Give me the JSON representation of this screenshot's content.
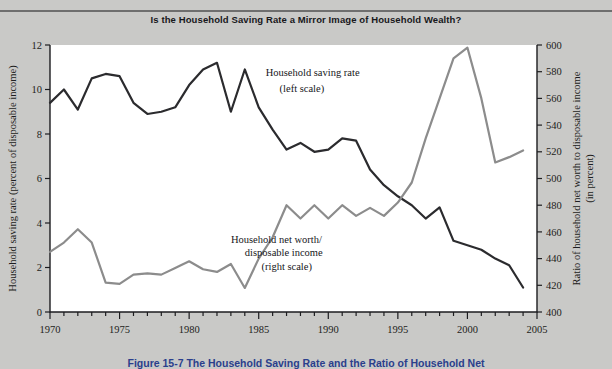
{
  "figure": {
    "title": "Is the Household Saving Rate a Mirror Image of Household Wealth?",
    "caption": "Figure 15-7 The Household Saving Rate and the Ratio of Household Net"
  },
  "chart_data": {
    "type": "line",
    "title": "Is the Household Saving Rate a Mirror Image of Household Wealth?",
    "xlabel": "",
    "ylabel": "Household saving rate (percent of disposable income)",
    "y2label": "Ratio of household net worth to disposable income (in percent)",
    "xlim": [
      1970,
      2005
    ],
    "ylim": [
      0,
      12
    ],
    "y2lim": [
      400,
      600
    ],
    "xticks": [
      1970,
      1975,
      1980,
      1985,
      1990,
      1995,
      2000,
      2005
    ],
    "xtick_labels": [
      "1970",
      "1975",
      "1980",
      "1985",
      "1990",
      "1995",
      "2000",
      "2005"
    ],
    "xminor_step": 1,
    "yticks": [
      0,
      2,
      4,
      6,
      8,
      10,
      12
    ],
    "ytick_labels": [
      "0",
      "2",
      "4",
      "6",
      "8",
      "10",
      "12"
    ],
    "y2ticks": [
      400,
      420,
      440,
      460,
      480,
      500,
      520,
      540,
      560,
      580,
      600
    ],
    "y2tick_labels": [
      "400",
      "420",
      "440",
      "460",
      "480",
      "500",
      "520",
      "540",
      "560",
      "580",
      "600"
    ],
    "grid": false,
    "legend_position": "inline-annotation",
    "x": [
      1970,
      1971,
      1972,
      1973,
      1974,
      1975,
      1976,
      1977,
      1978,
      1979,
      1980,
      1981,
      1982,
      1983,
      1984,
      1985,
      1986,
      1987,
      1988,
      1989,
      1990,
      1991,
      1992,
      1993,
      1994,
      1995,
      1996,
      1997,
      1998,
      1999,
      2000,
      2001,
      2002,
      2003,
      2004
    ],
    "series": [
      {
        "name": "Household saving rate",
        "scale": "left",
        "units": "percent of disposable income",
        "color": "#2b2b2e",
        "annotation": "Household saving rate\n(left scale)",
        "values": [
          9.4,
          10.0,
          9.1,
          10.5,
          10.7,
          10.6,
          9.4,
          8.9,
          9.0,
          9.2,
          10.2,
          10.9,
          11.2,
          9.0,
          10.9,
          9.2,
          8.2,
          7.3,
          7.6,
          7.2,
          7.3,
          7.8,
          7.7,
          6.4,
          5.7,
          5.2,
          4.8,
          4.2,
          4.7,
          3.2,
          3.0,
          2.8,
          2.4,
          2.1,
          1.1
        ]
      },
      {
        "name": "Household net worth/disposable income",
        "scale": "right",
        "units": "percent",
        "color": "#8c8c8c",
        "annotation": "Household net worth/\ndisposable income\n(right scale)",
        "values": [
          445,
          452,
          462,
          452,
          422,
          421,
          428,
          429,
          428,
          433,
          438,
          432,
          430,
          436,
          418,
          440,
          456,
          480,
          470,
          480,
          470,
          480,
          472,
          478,
          472,
          482,
          497,
          530,
          560,
          590,
          598,
          560,
          512,
          516,
          521
        ]
      }
    ],
    "annotations": [
      {
        "text": "Household saving rate",
        "x": 1985.5,
        "y": 10.6,
        "scale": "left"
      },
      {
        "text": "(left scale)",
        "x": 1986.5,
        "y": 9.9,
        "scale": "left"
      },
      {
        "text": "Household net worth/",
        "x": 1983.0,
        "y": 3.1,
        "scale": "left"
      },
      {
        "text": "disposable income",
        "x": 1984.0,
        "y": 2.5,
        "scale": "left"
      },
      {
        "text": "(right scale)",
        "x": 1985.2,
        "y": 1.9,
        "scale": "left"
      }
    ]
  },
  "colors": {
    "background": "#c9c9c7",
    "plot_background": "#ffffff",
    "axis": "#1d1d20",
    "saving_rate_line": "#2b2b2e",
    "net_worth_line": "#8c8c8c",
    "caption_text": "#2b3f8c"
  }
}
